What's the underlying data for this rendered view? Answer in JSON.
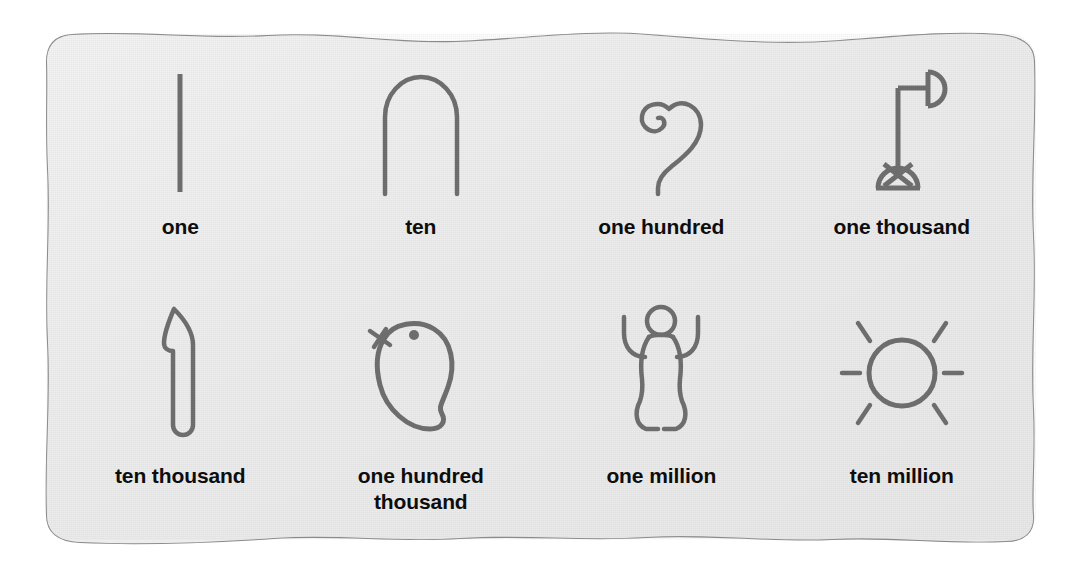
{
  "page": {
    "background_color": "#ffffff",
    "paper_color": "#eeeeee",
    "paper_edge_color": "#8a8a8a",
    "glyph_stroke_color": "#6d6d6d",
    "label_color": "#0d0d0d"
  },
  "grid": {
    "columns": 4,
    "rows": 2
  },
  "glyphs": [
    {
      "id": "one",
      "label": "one",
      "value": 1,
      "icon": "single-stroke-icon",
      "description": "single vertical stroke"
    },
    {
      "id": "ten",
      "label": "ten",
      "value": 10,
      "icon": "heel-bone-arch-icon",
      "description": "inverted U heel bone / hobble"
    },
    {
      "id": "one-hundred",
      "label": "one hundred",
      "value": 100,
      "icon": "coiled-rope-icon",
      "description": "coiled rope spiral"
    },
    {
      "id": "one-thousand",
      "label": "one thousand",
      "value": 1000,
      "icon": "lotus-flower-icon",
      "description": "lotus flower on a stem"
    },
    {
      "id": "ten-thousand",
      "label": "ten thousand",
      "value": 10000,
      "icon": "pointing-finger-icon",
      "description": "bent pointing finger"
    },
    {
      "id": "one-hundred-thousand",
      "label": "one hundred\nthousand",
      "value": 100000,
      "icon": "tadpole-icon",
      "description": "tadpole or frog"
    },
    {
      "id": "one-million",
      "label": "one million",
      "value": 1000000,
      "icon": "heh-god-figure-icon",
      "description": "kneeling god with raised arms"
    },
    {
      "id": "ten-million",
      "label": "ten million",
      "value": 10000000,
      "icon": "sun-icon",
      "description": "sun disc with six rays"
    }
  ]
}
